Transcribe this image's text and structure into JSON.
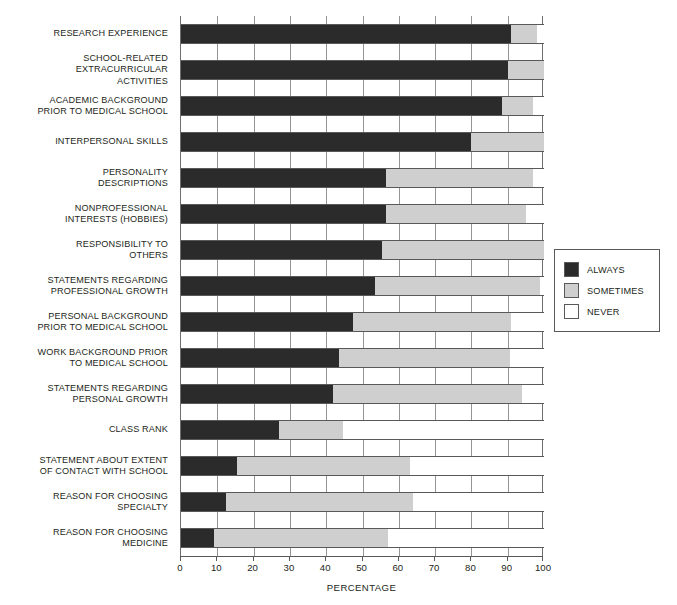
{
  "chart_data": {
    "type": "bar",
    "orientation": "horizontal",
    "stacked": true,
    "title": "",
    "xlabel": "PERCENTAGE",
    "ylabel": "",
    "xlim": [
      0,
      100
    ],
    "xticks": [
      0,
      10,
      20,
      30,
      40,
      50,
      60,
      70,
      80,
      90,
      100
    ],
    "xticklabels": [
      "0",
      "10",
      "20",
      "30",
      "40",
      "50",
      "60",
      "70",
      "80",
      "90",
      "100"
    ],
    "grid": true,
    "legend_position": "right",
    "legend": [
      "ALWAYS",
      "SOMETIMES",
      "NEVER"
    ],
    "colors": {
      "always": "#2b2b2b",
      "sometimes": "#cfcfcf",
      "never": "#ffffff",
      "axis": "#58595b",
      "grid": "#939598",
      "text": "#231f20"
    },
    "categories": [
      "RESEARCH EXPERIENCE",
      "SCHOOL-RELATED\nEXTRACURRICULAR\nACTIVITIES",
      "ACADEMIC BACKGROUND\nPRIOR TO MEDICAL SCHOOL",
      "INTERPERSONAL SKILLS",
      "PERSONALITY\nDESCRIPTIONS",
      "NONPROFESSIONAL\nINTERESTS (HOBBIES)",
      "RESPONSIBILITY TO\nOTHERS",
      "STATEMENTS REGARDING\nPROFESSIONAL GROWTH",
      "PERSONAL BACKGROUND\nPRIOR TO MEDICAL SCHOOL",
      "WORK BACKGROUND PRIOR\nTO MEDICAL SCHOOL",
      "STATEMENTS REGARDING\nPERSONAL GROWTH",
      "CLASS RANK",
      "STATEMENT ABOUT EXTENT\nOF CONTACT WITH SCHOOL",
      "REASON FOR CHOOSING\nSPECIALTY",
      "REASON FOR CHOOSING\nMEDICINE"
    ],
    "series": [
      {
        "name": "ALWAYS",
        "values": [
          91,
          90,
          88.5,
          80,
          56.5,
          56.5,
          55.5,
          53.5,
          47.5,
          43.5,
          42,
          27,
          15.5,
          12.5,
          9
        ]
      },
      {
        "name": "SOMETIMES",
        "values": [
          7,
          10,
          8.5,
          20,
          40.5,
          38.5,
          44.5,
          45.5,
          43.5,
          47,
          52,
          17.5,
          47.5,
          51.5,
          48
        ]
      },
      {
        "name": "NEVER",
        "values": [
          2,
          0,
          3,
          0,
          3,
          5,
          0,
          1,
          9,
          9.5,
          6,
          55.5,
          37,
          36,
          43
        ]
      }
    ]
  }
}
